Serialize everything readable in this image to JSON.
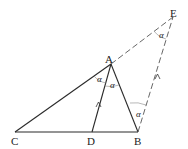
{
  "diagram": {
    "type": "geometry",
    "points": {
      "A": {
        "label": "A",
        "x": 111,
        "y": 64
      },
      "B": {
        "label": "B",
        "x": 138,
        "y": 132
      },
      "C": {
        "label": "C",
        "x": 15,
        "y": 132
      },
      "D": {
        "label": "D",
        "x": 92,
        "y": 132
      },
      "E": {
        "label": "E",
        "x": 173,
        "y": 17
      }
    },
    "segments": [
      {
        "from": "C",
        "to": "B",
        "style": "solid"
      },
      {
        "from": "C",
        "to": "A",
        "style": "solid"
      },
      {
        "from": "A",
        "to": "B",
        "style": "solid"
      },
      {
        "from": "A",
        "to": "D",
        "style": "solid"
      },
      {
        "from": "A",
        "to": "E",
        "style": "dashed"
      },
      {
        "from": "B",
        "to": "E",
        "style": "dashed"
      }
    ],
    "parallel_marks": [
      "AD",
      "BE"
    ],
    "angle_symbol": "α",
    "angles": [
      {
        "at": "A",
        "between": "CA-AD",
        "label": "α"
      },
      {
        "at": "A",
        "between": "AD-AB",
        "label": "α"
      },
      {
        "at": "E",
        "between": "EA-EB",
        "label": "α"
      },
      {
        "at": "B",
        "between": "BA-BE",
        "label": "α"
      }
    ]
  }
}
